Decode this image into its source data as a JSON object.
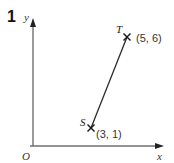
{
  "question": {
    "number": "1"
  },
  "axes": {
    "x_label": "x",
    "y_label": "y",
    "origin_label": "O",
    "axis_color": "#6e6e6e"
  },
  "points": [
    {
      "name": "S",
      "coords": "(3, 1)",
      "x": 3,
      "y": 1
    },
    {
      "name": "T",
      "coords": "(5, 6)",
      "x": 5,
      "y": 6
    }
  ],
  "segment": {
    "from": "S",
    "to": "T",
    "color": "#2b2b2b"
  }
}
